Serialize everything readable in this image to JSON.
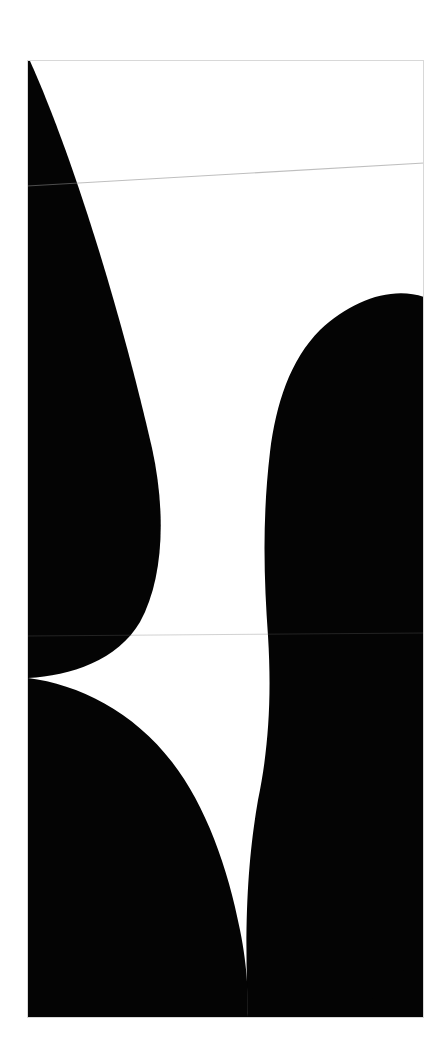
{
  "page": {
    "width": 447,
    "height": 1064,
    "background_color": "#ffffff"
  },
  "artwork": {
    "name": "hourglass-curve-composition",
    "description": "Two large black circular-arc masses separated by a white S-shaped band that pinches to points at the left and right edges",
    "ink_color": "#040404",
    "paper_color": "#ffffff",
    "panel": {
      "left": 27,
      "top": 60,
      "right": 424,
      "bottom": 1018,
      "width": 397,
      "height": 958,
      "border_color": "#d8d8d8"
    },
    "shapes": [
      {
        "name": "black-mass-upper-left",
        "fill": "#040404",
        "path": "M27,60 L27,1018 L27,678 Z"
      },
      {
        "name": "black-mass-upper-right",
        "fill": "#040404"
      },
      {
        "name": "white-band",
        "fill": "#ffffff"
      }
    ],
    "pinch_points": [
      {
        "name": "left-pinch-point",
        "x": 28,
        "y": 678
      },
      {
        "name": "right-pinch-point",
        "x": 424,
        "y": 297
      }
    ],
    "edge_crossings": [
      {
        "name": "top-edge-white-start",
        "x": 30,
        "y": 61
      },
      {
        "name": "top-edge-white-end",
        "x": 186,
        "y": 61
      },
      {
        "name": "bottom-edge-white-start",
        "x": 248,
        "y": 1017
      },
      {
        "name": "bottom-edge-white-end",
        "x": 424,
        "y": 1017
      }
    ],
    "seam_lines": [
      {
        "name": "seam-line-upper",
        "color": "#8a8a8a",
        "x1": 27,
        "y1": 186,
        "x2": 424,
        "y2": 163,
        "opacity": 0.55
      },
      {
        "name": "seam-line-middle",
        "color": "#6a6a6a",
        "x1": 27,
        "y1": 636,
        "x2": 424,
        "y2": 633,
        "opacity": 0.3
      }
    ]
  },
  "chart_data": {
    "type": "area",
    "xlabel": "",
    "ylabel": "",
    "categories": [],
    "series": [
      {
        "name": "white-band-left-boundary",
        "x": [
          61,
          130,
          190,
          250,
          300,
          360,
          420,
          465,
          520,
          580,
          636,
          678,
          720,
          780,
          840,
          905,
          960,
          1017
        ],
        "values": [
          30,
          62,
          88,
          108,
          124,
          140,
          151,
          158,
          160,
          152,
          130,
          28,
          92,
          172,
          205,
          228,
          240,
          248
        ]
      },
      {
        "name": "white-band-right-boundary",
        "x": [
          61,
          130,
          190,
          250,
          297,
          360,
          420,
          465,
          520,
          580,
          636,
          678,
          720,
          780,
          840,
          905,
          960,
          1017
        ],
        "values": [
          186,
          250,
          300,
          370,
          424,
          352,
          300,
          278,
          268,
          266,
          268,
          272,
          266,
          258,
          284,
          318,
          362,
          424
        ]
      }
    ],
    "ylim": [
      60,
      1018
    ],
    "xlim": [
      27,
      424
    ],
    "grid": false,
    "legend_position": "none"
  }
}
